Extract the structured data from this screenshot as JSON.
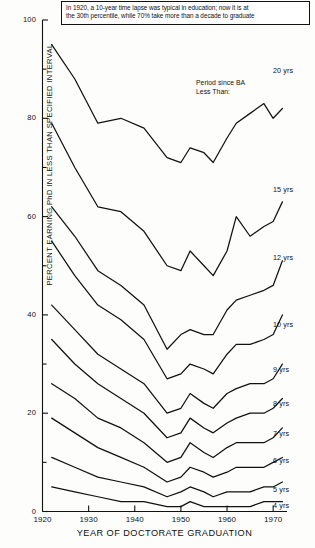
{
  "caption": {
    "line1": "In 1920, a 10-year time lapse was typical in education; now it is at",
    "line2": "the 30th percentile, while 70% take more than a decade to graduate"
  },
  "legend": {
    "header_line1": "Period since BA",
    "header_line2": "Less Than:"
  },
  "axes": {
    "ylabel": "PERCENT EARNING PhD IN LESS THAN SPECIFIED INTERVAL",
    "xlabel": "YEAR OF DOCTORATE GRADUATION",
    "yticks": [
      "0",
      "20",
      "40",
      "60",
      "80",
      "100"
    ],
    "xticks": [
      "1920",
      "1930",
      "1940",
      "1950",
      "1960",
      "1970"
    ]
  },
  "chart_data": {
    "type": "line",
    "title": "",
    "subtitle": "In 1920, a 10-year time lapse was typical in education; now it is at the 30th percentile, while 70% take more than a decade to graduate",
    "xlabel": "YEAR OF DOCTORATE GRADUATION",
    "ylabel": "PERCENT EARNING PhD IN LESS THAN SPECIFIED INTERVAL",
    "xlim": [
      1920,
      1973
    ],
    "ylim": [
      0,
      100
    ],
    "xticks": [
      1920,
      1930,
      1940,
      1950,
      1960,
      1970
    ],
    "yticks": [
      0,
      20,
      40,
      60,
      80,
      100
    ],
    "yminorticks": [
      10,
      30,
      50,
      70,
      90
    ],
    "grid": false,
    "legend": "right-inline",
    "legend_title": "Period since BA Less Than:",
    "x": [
      1922,
      1927,
      1932,
      1937,
      1942,
      1947,
      1950,
      1952,
      1955,
      1957,
      1960,
      1962,
      1965,
      1968,
      1970,
      1972
    ],
    "series": [
      {
        "name": "20 yrs",
        "values": [
          95,
          88,
          79,
          80,
          78,
          72,
          71,
          74,
          73,
          71,
          76,
          79,
          81,
          83,
          80,
          82
        ]
      },
      {
        "name": "15 yrs",
        "values": [
          79,
          70,
          62,
          61,
          57,
          50,
          49,
          53,
          50,
          48,
          53,
          60,
          56,
          58,
          59,
          63
        ]
      },
      {
        "name": "12 yrs",
        "values": [
          62,
          56,
          49,
          46,
          42,
          33,
          36,
          37,
          36,
          36,
          41,
          43,
          44,
          45,
          46,
          51
        ]
      },
      {
        "name": "10 yrs",
        "values": [
          55,
          48,
          42,
          39,
          35,
          27,
          28,
          30,
          29,
          28,
          32,
          34,
          34,
          35,
          36,
          40
        ]
      },
      {
        "name": "9 yrs",
        "values": [
          42,
          37,
          32,
          29,
          26,
          20,
          21,
          24,
          22,
          21,
          24,
          25,
          26,
          26,
          27,
          30
        ]
      },
      {
        "name": "8 yrs",
        "values": [
          35,
          30,
          26,
          23,
          20,
          15,
          16,
          19,
          17,
          16,
          18,
          19,
          20,
          20,
          21,
          23
        ]
      },
      {
        "name": "7 yrs",
        "values": [
          26,
          23,
          19,
          17,
          14,
          10,
          11,
          14,
          12,
          11,
          13,
          14,
          14,
          14,
          15,
          17
        ]
      },
      {
        "name": "6 yrs",
        "values": [
          19,
          16,
          13,
          11,
          9,
          6,
          7,
          9,
          8,
          7,
          8,
          9,
          9,
          9,
          10,
          11
        ]
      },
      {
        "name": "5 yrs",
        "values": [
          11,
          9,
          7,
          6,
          5,
          3,
          4,
          5,
          4,
          3,
          4,
          4,
          4,
          5,
          5,
          6
        ]
      },
      {
        "name": "4 yrs",
        "values": [
          5,
          4,
          3,
          2,
          2,
          1,
          1,
          2,
          1,
          1,
          1,
          1,
          1,
          2,
          2,
          2
        ]
      }
    ]
  },
  "series_labels": [
    {
      "name": "20 yrs",
      "x": 273,
      "y": 71
    },
    {
      "name": "15 yrs",
      "x": 273,
      "y": 190
    },
    {
      "name": "12 yrs",
      "x": 273,
      "y": 258
    },
    {
      "name": "10 yrs",
      "x": 273,
      "y": 325
    },
    {
      "name": "9 yrs",
      "x": 273,
      "y": 370
    },
    {
      "name": "8 yrs",
      "x": 273,
      "y": 404
    },
    {
      "name": "7 yrs",
      "x": 273,
      "y": 434
    },
    {
      "name": "6 yrs",
      "x": 273,
      "y": 461
    },
    {
      "name": "5 yrs",
      "x": 273,
      "y": 490
    },
    {
      "name": "4 yrs",
      "x": 273,
      "y": 506
    }
  ]
}
